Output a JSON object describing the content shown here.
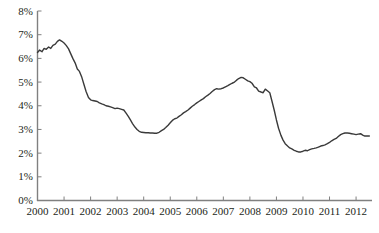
{
  "chart_data": {
    "type": "line",
    "title": "",
    "subtitle": "",
    "xlabel": "",
    "ylabel": "",
    "xlim": [
      2000.0,
      2012.6
    ],
    "ylim": [
      0,
      8
    ],
    "grid": false,
    "legend": null,
    "line_color": "#3a3a3a",
    "axis_color": "#7f7f7f",
    "y_tick_labels": [
      "8%",
      "7%",
      "6%",
      "5%",
      "4%",
      "3%",
      "2%",
      "1%",
      "0%"
    ],
    "y_tick_values": [
      8,
      7,
      6,
      5,
      4,
      3,
      2,
      1,
      0
    ],
    "x_tick_labels": [
      "2000",
      "2001",
      "2002",
      "2003",
      "2004",
      "2005",
      "2006",
      "2007",
      "2008",
      "2009",
      "2010",
      "2011",
      "2012"
    ],
    "x_tick_values": [
      2000,
      2001,
      2002,
      2003,
      2004,
      2005,
      2006,
      2007,
      2008,
      2009,
      2010,
      2011,
      2012
    ],
    "series": [
      {
        "name": "rate",
        "x": [
          2000.0,
          2000.08,
          2000.17,
          2000.25,
          2000.33,
          2000.42,
          2000.5,
          2000.58,
          2000.67,
          2000.75,
          2000.83,
          2000.92,
          2001.0,
          2001.08,
          2001.17,
          2001.25,
          2001.33,
          2001.42,
          2001.5,
          2001.58,
          2001.67,
          2001.75,
          2001.83,
          2001.92,
          2002.0,
          2002.08,
          2002.17,
          2002.25,
          2002.33,
          2002.42,
          2002.5,
          2002.58,
          2002.67,
          2002.75,
          2002.83,
          2002.92,
          2003.0,
          2003.08,
          2003.17,
          2003.25,
          2003.33,
          2003.42,
          2003.5,
          2003.58,
          2003.67,
          2003.75,
          2003.83,
          2003.92,
          2004.0,
          2004.08,
          2004.17,
          2004.25,
          2004.33,
          2004.42,
          2004.5,
          2004.58,
          2004.67,
          2004.75,
          2004.83,
          2004.92,
          2005.0,
          2005.08,
          2005.17,
          2005.25,
          2005.33,
          2005.42,
          2005.5,
          2005.58,
          2005.67,
          2005.75,
          2005.83,
          2005.92,
          2006.0,
          2006.08,
          2006.17,
          2006.25,
          2006.33,
          2006.42,
          2006.5,
          2006.58,
          2006.67,
          2006.75,
          2006.83,
          2006.92,
          2007.0,
          2007.08,
          2007.17,
          2007.25,
          2007.33,
          2007.42,
          2007.5,
          2007.58,
          2007.67,
          2007.75,
          2007.83,
          2007.92,
          2008.0,
          2008.08,
          2008.17,
          2008.25,
          2008.33,
          2008.42,
          2008.5,
          2008.58,
          2008.67,
          2008.75,
          2008.83,
          2008.92,
          2009.0,
          2009.08,
          2009.17,
          2009.25,
          2009.33,
          2009.42,
          2009.5,
          2009.58,
          2009.67,
          2009.75,
          2009.83,
          2009.92,
          2010.0,
          2010.08,
          2010.17,
          2010.25,
          2010.33,
          2010.42,
          2010.5,
          2010.58,
          2010.67,
          2010.75,
          2010.83,
          2010.92,
          2011.0,
          2011.08,
          2011.17,
          2011.25,
          2011.33,
          2011.42,
          2011.5,
          2011.58,
          2011.67,
          2011.75,
          2011.83,
          2011.92,
          2012.0,
          2012.08,
          2012.17,
          2012.25,
          2012.33,
          2012.42,
          2012.5
        ],
        "values": [
          6.25,
          6.35,
          6.28,
          6.42,
          6.38,
          6.48,
          6.42,
          6.55,
          6.6,
          6.72,
          6.78,
          6.72,
          6.65,
          6.55,
          6.4,
          6.2,
          6.0,
          5.8,
          5.55,
          5.45,
          5.2,
          4.9,
          4.6,
          4.35,
          4.25,
          4.22,
          4.2,
          4.18,
          4.12,
          4.08,
          4.05,
          4.0,
          3.98,
          3.95,
          3.92,
          3.88,
          3.9,
          3.88,
          3.85,
          3.82,
          3.7,
          3.55,
          3.4,
          3.25,
          3.1,
          3.0,
          2.92,
          2.88,
          2.87,
          2.86,
          2.86,
          2.85,
          2.85,
          2.84,
          2.84,
          2.88,
          2.95,
          3.0,
          3.08,
          3.18,
          3.28,
          3.38,
          3.45,
          3.48,
          3.55,
          3.62,
          3.7,
          3.75,
          3.82,
          3.9,
          3.98,
          4.05,
          4.12,
          4.18,
          4.25,
          4.3,
          4.38,
          4.45,
          4.52,
          4.6,
          4.68,
          4.72,
          4.7,
          4.72,
          4.75,
          4.8,
          4.85,
          4.9,
          4.95,
          5.0,
          5.08,
          5.15,
          5.2,
          5.18,
          5.12,
          5.05,
          5.02,
          4.95,
          4.8,
          4.75,
          4.62,
          4.58,
          4.55,
          4.7,
          4.62,
          4.55,
          4.2,
          3.8,
          3.4,
          3.05,
          2.75,
          2.55,
          2.4,
          2.3,
          2.22,
          2.18,
          2.12,
          2.08,
          2.05,
          2.05,
          2.08,
          2.12,
          2.1,
          2.15,
          2.18,
          2.2,
          2.22,
          2.25,
          2.3,
          2.32,
          2.35,
          2.4,
          2.45,
          2.52,
          2.58,
          2.62,
          2.7,
          2.78,
          2.82,
          2.85,
          2.85,
          2.84,
          2.82,
          2.8,
          2.78,
          2.8,
          2.82,
          2.76,
          2.72,
          2.72,
          2.72
        ]
      }
    ]
  },
  "axes": {
    "y_axis_name": "y-axis",
    "x_axis_name": "x-axis"
  }
}
